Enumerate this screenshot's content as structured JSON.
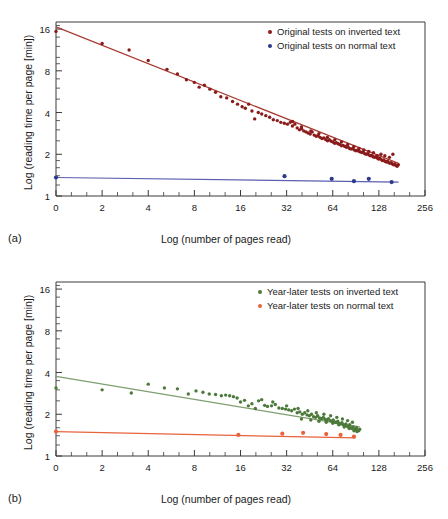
{
  "figure": {
    "background": "#ffffff",
    "panels": [
      {
        "id": "a",
        "label": "(a)",
        "legend": [
          {
            "text": "Original tests on inverted text",
            "color": "#8B1A1A"
          },
          {
            "text": "Original tests on normal text",
            "color": "#2B3A8F"
          }
        ]
      },
      {
        "id": "b",
        "label": "(b)",
        "legend": [
          {
            "text": "Year-later tests on inverted text",
            "color": "#4C7A3A"
          },
          {
            "text": "Year-later tests on normal text",
            "color": "#E8623C"
          }
        ]
      }
    ]
  },
  "chart_data": [
    {
      "type": "scatter",
      "panel": "(a)",
      "title": "",
      "xlabel": "Log (number of pages read)",
      "ylabel": "Log (reading time per page  [min])",
      "xscale": "log2",
      "yscale": "log2",
      "xtick_labels": [
        "0",
        "2",
        "4",
        "8",
        "16",
        "32",
        "64",
        "128",
        "256"
      ],
      "xtick_positions": [
        0,
        2,
        4,
        8,
        16,
        32,
        64,
        128,
        256
      ],
      "ytick_labels": [
        "16",
        "8",
        "4",
        "2",
        "1"
      ],
      "ytick_positions": [
        16,
        8,
        4,
        2,
        1
      ],
      "xlim": [
        0,
        256
      ],
      "ylim": [
        1,
        18
      ],
      "grid": false,
      "legend_position": "top-right",
      "series": [
        {
          "name": "Original tests on inverted text",
          "color": "#8B1A1A",
          "marker": "circle",
          "fit_line": {
            "from": [
              0,
              16.6
            ],
            "to": [
              172,
              1.72
            ],
            "color": "#A83A32"
          },
          "points": [
            [
              0,
              15.4
            ],
            [
              2,
              12.6
            ],
            [
              3,
              11.3
            ],
            [
              4,
              9.5
            ],
            [
              5.3,
              8.2
            ],
            [
              6.2,
              7.6
            ],
            [
              7.1,
              6.9
            ],
            [
              8,
              6.6
            ],
            [
              8.6,
              6.1
            ],
            [
              9.3,
              6.3
            ],
            [
              10.1,
              5.9
            ],
            [
              11,
              5.6
            ],
            [
              11.9,
              5.2
            ],
            [
              13,
              5.1
            ],
            [
              14.2,
              4.8
            ],
            [
              15.3,
              4.6
            ],
            [
              16.4,
              4.4
            ],
            [
              17.2,
              4.3
            ],
            [
              18.1,
              4.6
            ],
            [
              19,
              4.1
            ],
            [
              19.8,
              3.6
            ],
            [
              20.9,
              4.0
            ],
            [
              22,
              3.9
            ],
            [
              23.4,
              3.8
            ],
            [
              24.8,
              3.7
            ],
            [
              26.2,
              3.55
            ],
            [
              27.8,
              3.5
            ],
            [
              29.3,
              3.4
            ],
            [
              30.9,
              3.35
            ],
            [
              32.4,
              3.3
            ],
            [
              33.8,
              3.4
            ],
            [
              34.9,
              3.2
            ],
            [
              36.2,
              3.3
            ],
            [
              37.5,
              3.1
            ],
            [
              38.8,
              3.0
            ],
            [
              40.1,
              3.05
            ],
            [
              41.4,
              2.95
            ],
            [
              42.8,
              2.9
            ],
            [
              44.2,
              2.85
            ],
            [
              45.6,
              2.8
            ],
            [
              47,
              2.9
            ],
            [
              48.4,
              2.75
            ],
            [
              49.9,
              2.7
            ],
            [
              51.4,
              2.72
            ],
            [
              52.9,
              2.65
            ],
            [
              54.4,
              2.6
            ],
            [
              56,
              2.62
            ],
            [
              57.6,
              2.55
            ],
            [
              59.2,
              2.5
            ],
            [
              60.8,
              2.55
            ],
            [
              62.5,
              2.48
            ],
            [
              64.2,
              2.45
            ],
            [
              65.9,
              2.4
            ],
            [
              67.6,
              2.42
            ],
            [
              69.4,
              2.38
            ],
            [
              71.2,
              2.35
            ],
            [
              73,
              2.3
            ],
            [
              74.8,
              2.32
            ],
            [
              76.7,
              2.28
            ],
            [
              78.6,
              2.25
            ],
            [
              80.5,
              2.26
            ],
            [
              82.4,
              2.2
            ],
            [
              84.4,
              2.18
            ],
            [
              86.4,
              2.2
            ],
            [
              88.4,
              2.15
            ],
            [
              90.5,
              2.12
            ],
            [
              92.6,
              2.14
            ],
            [
              94.7,
              2.1
            ],
            [
              96.8,
              2.08
            ],
            [
              99,
              2.06
            ],
            [
              101.2,
              2.08
            ],
            [
              103.4,
              2.02
            ],
            [
              105.7,
              2.0
            ],
            [
              108,
              2.02
            ],
            [
              110.3,
              1.98
            ],
            [
              112.6,
              1.95
            ],
            [
              115,
              1.96
            ],
            [
              117.4,
              1.92
            ],
            [
              119.8,
              1.9
            ],
            [
              122.3,
              1.92
            ],
            [
              124.8,
              1.88
            ],
            [
              127.3,
              1.85
            ],
            [
              129.8,
              1.87
            ],
            [
              132.4,
              1.83
            ],
            [
              135,
              1.8
            ],
            [
              137.6,
              1.82
            ],
            [
              140.3,
              1.78
            ],
            [
              143,
              1.76
            ],
            [
              145.7,
              1.78
            ],
            [
              148.4,
              1.74
            ],
            [
              151.2,
              1.72
            ],
            [
              154,
              1.74
            ],
            [
              156.8,
              1.7
            ],
            [
              159.7,
              1.68
            ],
            [
              162.6,
              1.7
            ],
            [
              165.5,
              1.66
            ],
            [
              168.5,
              1.64
            ],
            [
              171.5,
              1.68
            ],
            [
              158,
              2.0
            ],
            [
              150,
              1.9
            ],
            [
              140,
              1.95
            ],
            [
              132,
              2.0
            ],
            [
              125,
              1.95
            ],
            [
              118,
              2.05
            ],
            [
              110,
              2.1
            ],
            [
              102,
              2.15
            ],
            [
              95,
              2.2
            ],
            [
              88,
              2.28
            ],
            [
              80,
              2.35
            ],
            [
              73,
              2.45
            ],
            [
              66,
              2.55
            ],
            [
              59,
              2.65
            ],
            [
              52,
              2.82
            ],
            [
              46,
              2.95
            ],
            [
              40,
              3.15
            ],
            [
              35,
              3.45
            ]
          ]
        },
        {
          "name": "Original tests on normal text",
          "color": "#2B3A8F",
          "marker": "circle",
          "fit_line": {
            "from": [
              0,
              1.36
            ],
            "to": [
              172,
              1.26
            ],
            "color": "#5A5FAF"
          },
          "points": [
            [
              0,
              1.36
            ],
            [
              31,
              1.39
            ],
            [
              63,
              1.33
            ],
            [
              88,
              1.28
            ],
            [
              110,
              1.33
            ],
            [
              155,
              1.26
            ]
          ]
        }
      ]
    },
    {
      "type": "scatter",
      "panel": "(b)",
      "title": "",
      "xlabel": "Log (number of pages read)",
      "ylabel": "Log (reading time per page [min])",
      "xscale": "log2",
      "yscale": "log2",
      "xtick_labels": [
        "0",
        "2",
        "4",
        "8",
        "16",
        "32",
        "64",
        "128",
        "256"
      ],
      "xtick_positions": [
        0,
        2,
        4,
        8,
        16,
        32,
        64,
        128,
        256
      ],
      "ytick_labels": [
        "16",
        "8",
        "4",
        "2",
        "1"
      ],
      "ytick_positions": [
        16,
        8,
        4,
        2,
        1
      ],
      "xlim": [
        0,
        256
      ],
      "ylim": [
        1,
        18
      ],
      "grid": false,
      "legend_position": "top-right",
      "series": [
        {
          "name": "Year-later tests on inverted text",
          "color": "#4C7A3A",
          "marker": "circle",
          "fit_line": {
            "from": [
              0,
              3.75
            ],
            "to": [
              96,
              1.62
            ],
            "color": "#7E9E6E"
          },
          "points": [
            [
              0,
              3.1
            ],
            [
              2,
              3.0
            ],
            [
              3.1,
              2.85
            ],
            [
              4,
              3.3
            ],
            [
              5.1,
              3.1
            ],
            [
              6.2,
              3.05
            ],
            [
              7.3,
              2.8
            ],
            [
              8.2,
              2.95
            ],
            [
              9.1,
              2.88
            ],
            [
              10,
              2.8
            ],
            [
              11,
              2.78
            ],
            [
              12,
              2.72
            ],
            [
              12.8,
              2.75
            ],
            [
              13.6,
              2.72
            ],
            [
              14.4,
              2.68
            ],
            [
              15.2,
              2.62
            ],
            [
              16,
              2.45
            ],
            [
              17,
              2.52
            ],
            [
              18,
              2.3
            ],
            [
              19,
              2.38
            ],
            [
              20,
              2.2
            ],
            [
              21,
              2.5
            ],
            [
              22,
              2.55
            ],
            [
              23,
              2.32
            ],
            [
              24,
              2.28
            ],
            [
              25.5,
              2.3
            ],
            [
              27,
              2.35
            ],
            [
              28.5,
              2.22
            ],
            [
              30,
              2.2
            ],
            [
              31.5,
              2.18
            ],
            [
              33,
              2.15
            ],
            [
              34.5,
              2.12
            ],
            [
              36,
              2.18
            ],
            [
              37.5,
              2.05
            ],
            [
              39,
              2.08
            ],
            [
              40.5,
              2.0
            ],
            [
              42,
              2.05
            ],
            [
              43.5,
              1.98
            ],
            [
              45,
              1.95
            ],
            [
              46.5,
              2.0
            ],
            [
              48,
              1.92
            ],
            [
              49.5,
              1.9
            ],
            [
              51,
              1.95
            ],
            [
              52.5,
              1.88
            ],
            [
              54,
              1.86
            ],
            [
              55.5,
              1.9
            ],
            [
              57,
              1.84
            ],
            [
              58.5,
              1.82
            ],
            [
              60,
              1.86
            ],
            [
              61.5,
              1.8
            ],
            [
              63,
              1.78
            ],
            [
              64.5,
              1.82
            ],
            [
              66,
              1.76
            ],
            [
              67.5,
              1.74
            ],
            [
              69,
              1.78
            ],
            [
              70.5,
              1.72
            ],
            [
              72,
              1.7
            ],
            [
              73.5,
              1.74
            ],
            [
              75,
              1.68
            ],
            [
              76.5,
              1.66
            ],
            [
              78,
              1.7
            ],
            [
              79.5,
              1.64
            ],
            [
              81,
              1.62
            ],
            [
              82.5,
              1.68
            ],
            [
              84,
              1.6
            ],
            [
              85.5,
              1.58
            ],
            [
              87,
              1.62
            ],
            [
              88.5,
              1.56
            ],
            [
              90,
              1.55
            ],
            [
              91.5,
              1.6
            ],
            [
              93,
              1.54
            ],
            [
              94.5,
              1.52
            ],
            [
              96,
              1.56
            ],
            [
              86,
              1.75
            ],
            [
              80,
              1.8
            ],
            [
              74,
              1.85
            ],
            [
              68,
              1.9
            ],
            [
              62,
              1.95
            ],
            [
              56,
              2.0
            ],
            [
              50,
              2.05
            ],
            [
              44,
              2.12
            ],
            [
              38,
              2.2
            ],
            [
              32,
              2.3
            ],
            [
              26,
              2.45
            ],
            [
              40,
              1.85
            ],
            [
              46,
              1.82
            ],
            [
              52,
              1.78
            ],
            [
              58,
              1.75
            ],
            [
              64,
              1.72
            ],
            [
              70,
              1.68
            ],
            [
              76,
              1.62
            ],
            [
              82,
              1.58
            ],
            [
              88,
              1.52
            ],
            [
              92,
              1.5
            ]
          ]
        },
        {
          "name": "Year-later tests on normal text",
          "color": "#E8623C",
          "marker": "circle",
          "fit_line": {
            "from": [
              0,
              1.5
            ],
            "to": [
              90,
              1.35
            ],
            "color": "#E8623C"
          },
          "points": [
            [
              0,
              1.5
            ],
            [
              15.5,
              1.42
            ],
            [
              30,
              1.45
            ],
            [
              41,
              1.47
            ],
            [
              58,
              1.44
            ],
            [
              72,
              1.42
            ],
            [
              88,
              1.38
            ]
          ]
        }
      ]
    }
  ]
}
